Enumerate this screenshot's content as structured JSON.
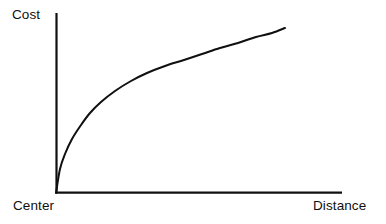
{
  "figure": {
    "background_color": "#ffffff",
    "ink_color": "#101010",
    "width": 386,
    "height": 224
  },
  "labels": {
    "y_axis": "Cost",
    "x_axis_start": "Center",
    "x_axis_end": "Distance"
  },
  "chart_data": {
    "type": "line",
    "title": "",
    "subtitle": "",
    "xlabel": "Distance",
    "ylabel": "Cost",
    "x_tick_labels": [
      "Center",
      "Distance"
    ],
    "y_tick_labels": [],
    "grid": false,
    "legend": null,
    "legend_position": "none",
    "annotations": [],
    "axis_style": {
      "x_axis_from_px": [
        56,
        193
      ],
      "x_axis_to_px": [
        342,
        193
      ],
      "y_axis_from_px": [
        56,
        193
      ],
      "y_axis_to_px": [
        56,
        13
      ],
      "line_width_px": 2.2,
      "arrowheads": false,
      "ticks": false
    },
    "xlim": [
      0,
      1
    ],
    "ylim": [
      0,
      1
    ],
    "series": [
      {
        "name": "Cost vs Distance",
        "color": "#101010",
        "line_width_px": 2.0,
        "x": [
          0.0,
          0.02,
          0.04,
          0.07,
          0.11,
          0.15,
          0.2,
          0.26,
          0.33,
          0.4,
          0.48,
          0.56,
          0.64,
          0.72,
          0.8,
          0.88,
          0.95,
          1.0
        ],
        "y": [
          0.0,
          0.15,
          0.24,
          0.33,
          0.42,
          0.49,
          0.56,
          0.63,
          0.69,
          0.74,
          0.79,
          0.83,
          0.87,
          0.9,
          0.93,
          0.96,
          0.98,
          1.0
        ],
        "pixel_points": [
          [
            56,
            193
          ],
          [
            60,
            169
          ],
          [
            65,
            154
          ],
          [
            72,
            139
          ],
          [
            81,
            125
          ],
          [
            90,
            113
          ],
          [
            101,
            102
          ],
          [
            115,
            91
          ],
          [
            131,
            81
          ],
          [
            147,
            73
          ],
          [
            165,
            66
          ],
          [
            184,
            60
          ],
          [
            202,
            54
          ],
          [
            220,
            48
          ],
          [
            238,
            43
          ],
          [
            256,
            37
          ],
          [
            272,
            33
          ],
          [
            285,
            28
          ]
        ]
      }
    ]
  }
}
